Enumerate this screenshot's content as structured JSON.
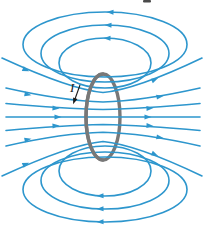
{
  "figure": {
    "type": "physics-diagram",
    "current_label": "I"
  },
  "colors": {
    "field_line": "#2D96CD",
    "coil": "#787878",
    "current": "#1A1A1A",
    "background": "#FFFFFF"
  },
  "field_lines": {
    "closed_loops_above": 3,
    "closed_loops_below": 3,
    "through_lines": 5,
    "corner_lines_per_side": 2,
    "flow_direction": "left to right through the loop, returning leftward over the top and bottom"
  }
}
